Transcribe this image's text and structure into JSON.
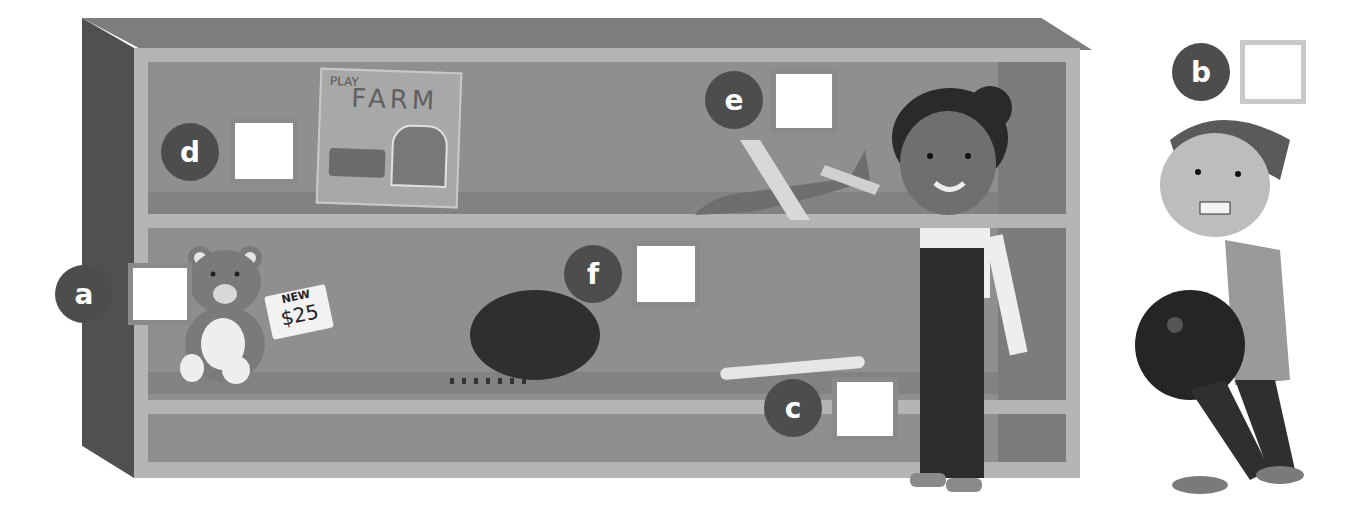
{
  "scene": {
    "description": "Toy shelf illustration with labeled answer boxes a–f",
    "colors": {
      "shelf_frame": "#b5b5b5",
      "shelf_panel": "#8f8f8f",
      "shelf_side": "#505050",
      "badge": "#4d4d4d",
      "answer_box_border": "#8a8a8a"
    }
  },
  "labels": [
    {
      "id": "a",
      "letter": "a"
    },
    {
      "id": "b",
      "letter": "b"
    },
    {
      "id": "c",
      "letter": "c"
    },
    {
      "id": "d",
      "letter": "d"
    },
    {
      "id": "e",
      "letter": "e"
    },
    {
      "id": "f",
      "letter": "f"
    }
  ],
  "items": {
    "farm_box": {
      "line1": "PLAY",
      "line2": "FARM"
    },
    "teddy_tag": {
      "line1": "NEW",
      "line2": "$25"
    },
    "coconut": "coconut",
    "pen": "fountain pen",
    "airplane": "toy airplane",
    "bowling_ball": "bowling ball"
  }
}
